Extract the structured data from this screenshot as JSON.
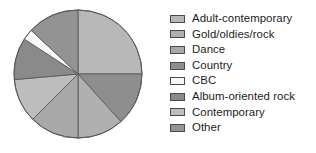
{
  "chart_data": {
    "type": "pie",
    "title": "",
    "legend_position": "right",
    "start_angle_deg": 0,
    "direction": "clockwise",
    "categories": [
      "Adult-contemporary",
      "Gold/oldies/rock",
      "Dance",
      "Country",
      "CBC",
      "Album-oriented rock",
      "Contemporary",
      "Other"
    ],
    "values": [
      25.0,
      11.7,
      12.5,
      13.3,
      2.8,
      10.6,
      11.1,
      13.0
    ],
    "unit": "percent",
    "colors": [
      "#b8b8b8",
      "#b0b0b0",
      "#a8a8a8",
      "#8e8e8e",
      "#f7f7f7",
      "#8a8a8a",
      "#bdbdbd",
      "#939393"
    ],
    "slice_order_clockwise_from_12": [
      "Adult-contemporary",
      "Country",
      "Gold/oldies/rock",
      "Dance",
      "Contemporary",
      "Album-oriented rock",
      "CBC",
      "Other"
    ],
    "slice_angles_deg": {
      "Adult-contemporary": 90,
      "Country": 48,
      "Gold/oldies/rock": 42,
      "Dance": 45,
      "Contemporary": 40,
      "Album-oriented rock": 38,
      "CBC": 10,
      "Other": 47
    },
    "stroke_color": "#5a5a5a"
  },
  "legend": {
    "items": [
      {
        "label": "Adult-contemporary",
        "color": "#b8b8b8"
      },
      {
        "label": "Gold/oldies/rock",
        "color": "#b0b0b0"
      },
      {
        "label": "Dance",
        "color": "#a8a8a8"
      },
      {
        "label": "Country",
        "color": "#8e8e8e"
      },
      {
        "label": "CBC",
        "color": "#f7f7f7"
      },
      {
        "label": "Album-oriented rock",
        "color": "#8a8a8a"
      },
      {
        "label": "Contemporary",
        "color": "#bdbdbd"
      },
      {
        "label": "Other",
        "color": "#939393"
      }
    ]
  }
}
